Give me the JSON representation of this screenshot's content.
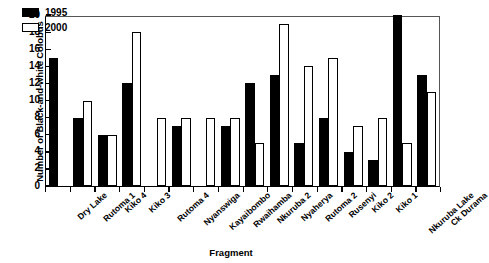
{
  "chart_data": {
    "type": "bar",
    "title": "",
    "xlabel": "Fragment",
    "ylabel": "Number of Black-and-white Colobus",
    "ylim": [
      0,
      20
    ],
    "ytick_step": 2,
    "yticks": [
      0,
      2,
      4,
      6,
      8,
      10,
      12,
      14,
      16,
      18,
      20
    ],
    "grid": false,
    "legend_position": "top-left",
    "categories": [
      "Dry Lake",
      "Rutoma 1",
      "Kiko 4",
      "Kiko 3",
      "Rutoma 4",
      "Nyanswiga",
      "Kayaibombo",
      "Rwaihamba",
      "Nkuruba 2",
      "Nyaherya",
      "Rutoma 2",
      "Rusenyi",
      "Kiko 2",
      "Kiko 1",
      "Nkuruba Lake",
      "Ck Durama"
    ],
    "series": [
      {
        "name": "1995",
        "color": "#000000",
        "values": [
          15,
          8,
          6,
          12,
          null,
          7,
          null,
          7,
          12,
          13,
          5,
          8,
          4,
          3,
          20,
          13
        ]
      },
      {
        "name": "2000",
        "color": "#ffffff",
        "values": [
          null,
          10,
          6,
          18,
          8,
          8,
          8,
          8,
          5,
          19,
          14,
          15,
          7,
          8,
          5,
          11
        ]
      }
    ]
  }
}
